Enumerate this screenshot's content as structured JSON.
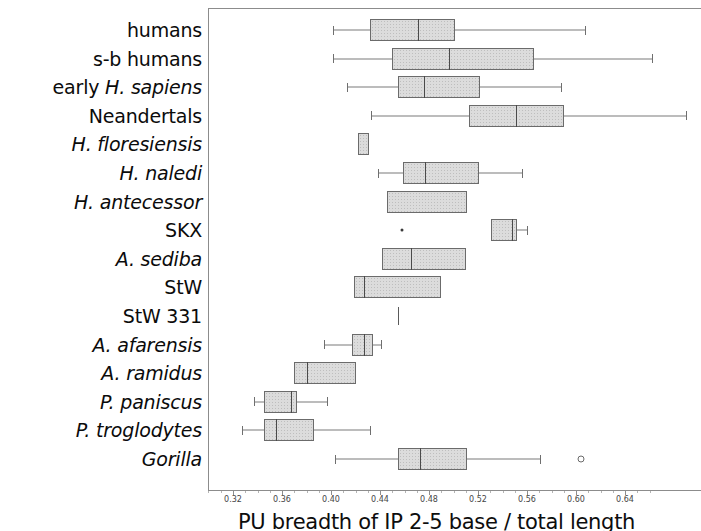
{
  "chart_data": {
    "type": "box",
    "title": "",
    "xlabel": "PU breadth of IP 2-5 base / total length",
    "ylabel": "",
    "xlim": [
      0.3,
      0.666
    ],
    "xticks": [
      0.32,
      0.36,
      0.4,
      0.44,
      0.48,
      0.52,
      0.56,
      0.6,
      0.64
    ],
    "xtick_labels": [
      "0.32",
      "0.36",
      "0.40",
      "0.44",
      "0.48",
      "0.52",
      "0.56",
      "0.60",
      "0.64"
    ],
    "grid": false,
    "legend": "none",
    "orientation": "horizontal",
    "categories": [
      "humans",
      "s-b humans",
      "early H. sapiens",
      "Neandertals",
      "H. floresiensis",
      "H. naledi",
      "H. antecessor",
      "SKX",
      "A. sediba",
      "StW",
      "StW 331",
      "A. afarensis",
      "A. ramidus",
      "P. paniscus",
      "P. troglodytes",
      "Gorilla"
    ],
    "boxes": [
      {
        "label": "humans",
        "whisker_low": 0.402,
        "q1": 0.432,
        "median": 0.471,
        "q3": 0.501,
        "whisker_high": 0.607,
        "outliers": []
      },
      {
        "label": "s-b humans",
        "whisker_low": 0.402,
        "q1": 0.45,
        "median": 0.496,
        "q3": 0.566,
        "whisker_high": 0.662,
        "outliers": []
      },
      {
        "label": "early H. sapiens",
        "whisker_low": 0.413,
        "q1": 0.455,
        "median": 0.476,
        "q3": 0.522,
        "whisker_high": 0.588,
        "outliers": []
      },
      {
        "label": "Neandertals",
        "whisker_low": 0.433,
        "q1": 0.513,
        "median": 0.551,
        "q3": 0.59,
        "whisker_high": 0.69,
        "outliers": []
      },
      {
        "label": "H. floresiensis",
        "whisker_low": 0.422,
        "q1": 0.422,
        "median": null,
        "q3": 0.431,
        "whisker_high": 0.431,
        "outliers": []
      },
      {
        "label": "H. naledi",
        "whisker_low": 0.438,
        "q1": 0.459,
        "median": 0.477,
        "q3": 0.521,
        "whisker_high": 0.556,
        "outliers": []
      },
      {
        "label": "H. antecessor",
        "whisker_low": null,
        "q1": 0.446,
        "median": null,
        "q3": 0.511,
        "whisker_high": null,
        "outliers": []
      },
      {
        "label": "SKX",
        "whisker_low": 0.531,
        "q1": 0.531,
        "median": 0.548,
        "q3": 0.552,
        "whisker_high": 0.56,
        "outliers": [
          0.458
        ]
      },
      {
        "label": "A. sediba",
        "whisker_low": null,
        "q1": 0.442,
        "median": 0.465,
        "q3": 0.51,
        "whisker_high": null,
        "outliers": []
      },
      {
        "label": "StW",
        "whisker_low": null,
        "q1": 0.419,
        "median": 0.427,
        "q3": 0.49,
        "whisker_high": null,
        "outliers": []
      },
      {
        "label": "StW 331",
        "whisker_low": null,
        "q1": null,
        "median": 0.455,
        "q3": null,
        "whisker_high": null,
        "outliers": []
      },
      {
        "label": "A. afarensis",
        "whisker_low": 0.394,
        "q1": 0.417,
        "median": 0.427,
        "q3": 0.434,
        "whisker_high": 0.441,
        "outliers": []
      },
      {
        "label": "A. ramidus",
        "whisker_low": null,
        "q1": 0.37,
        "median": 0.38,
        "q3": 0.42,
        "whisker_high": null,
        "outliers": []
      },
      {
        "label": "P. paniscus",
        "whisker_low": 0.337,
        "q1": 0.345,
        "median": 0.367,
        "q3": 0.372,
        "whisker_high": 0.397,
        "outliers": []
      },
      {
        "label": "P. troglodytes",
        "whisker_low": 0.327,
        "q1": 0.345,
        "median": 0.355,
        "q3": 0.386,
        "whisker_high": 0.432,
        "outliers": []
      },
      {
        "label": "Gorilla",
        "whisker_low": 0.403,
        "q1": 0.455,
        "median": 0.473,
        "q3": 0.511,
        "whisker_high": 0.571,
        "outliers": [
          0.604
        ]
      }
    ]
  },
  "labels": [
    {
      "text": "humans",
      "italic": false
    },
    {
      "text": "s-b humans",
      "italic": false
    },
    {
      "text": "early H. sapiens",
      "italic": false
    },
    {
      "text": "Neandertals",
      "italic": false
    },
    {
      "text": "H. floresiensis",
      "italic": true
    },
    {
      "text": "H. naledi",
      "italic": true
    },
    {
      "text": "H. antecessor",
      "italic": true
    },
    {
      "text": "SKX",
      "italic": false
    },
    {
      "text": "A. sediba",
      "italic": true
    },
    {
      "text": "StW",
      "italic": false
    },
    {
      "text": "StW 331",
      "italic": false
    },
    {
      "text": "A. afarensis",
      "italic": true
    },
    {
      "text": "A. ramidus",
      "italic": true
    },
    {
      "text": "P. paniscus",
      "italic": true
    },
    {
      "text": "P. troglodytes",
      "italic": true
    },
    {
      "text": "Gorilla",
      "italic": true
    }
  ],
  "axis": {
    "title": "PU breadth of IP 2-5 base / total length"
  },
  "style": {
    "box_fill": "#dcdcdc",
    "box_stroke": "#6b6b6b",
    "whisker": "#7a7a7a",
    "median": "#4a4a4a",
    "frame": "#8c8c8c",
    "text": "#0b0b0b"
  }
}
